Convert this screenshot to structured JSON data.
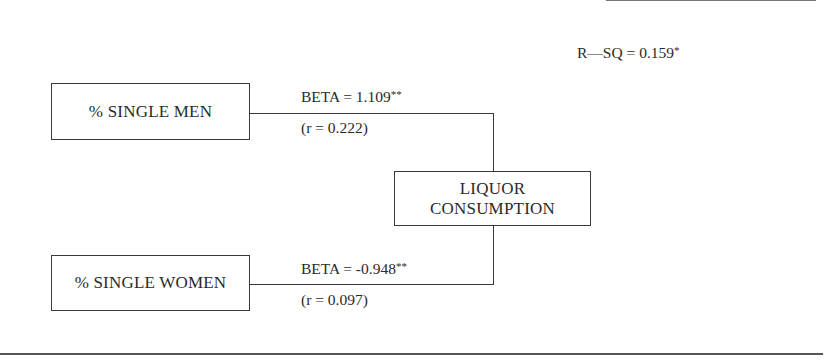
{
  "diagram": {
    "type": "path-diagram",
    "r_squared": {
      "label": "R—SQ = 0.159",
      "significance": "*"
    },
    "nodes": {
      "single_men": {
        "label": "% SINGLE MEN"
      },
      "single_women": {
        "label": "% SINGLE WOMEN"
      },
      "liquor": {
        "line1": "LIQUOR",
        "line2": "CONSUMPTION"
      }
    },
    "edges": [
      {
        "from": "% SINGLE MEN",
        "to": "LIQUOR CONSUMPTION",
        "beta_label": "BETA = 1.109",
        "beta_significance": "**",
        "r_label": "(r = 0.222)",
        "beta": 1.109,
        "r": 0.222
      },
      {
        "from": "% SINGLE WOMEN",
        "to": "LIQUOR CONSUMPTION",
        "beta_label": "BETA = -0.948",
        "beta_significance": "**",
        "r_label": "(r = 0.097)",
        "beta": -0.948,
        "r": 0.097
      }
    ]
  }
}
